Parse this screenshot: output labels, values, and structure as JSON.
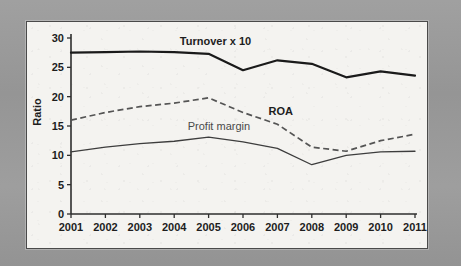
{
  "figure": {
    "panel_background": "#f4f3f0",
    "backdrop_color": "#9b9b9b",
    "border_color": "#4a4a4a"
  },
  "chart_data": {
    "type": "line",
    "title": "",
    "xlabel": "",
    "ylabel": "Ratio",
    "categories": [
      "2001",
      "2002",
      "2003",
      "2004",
      "2005",
      "2006",
      "2007",
      "2008",
      "2009",
      "2010",
      "2011"
    ],
    "x": [
      2001,
      2002,
      2003,
      2004,
      2005,
      2006,
      2007,
      2008,
      2009,
      2010,
      2011
    ],
    "ylim": [
      0,
      30
    ],
    "xlim": [
      2001,
      2011
    ],
    "yticks": [
      0,
      5,
      10,
      15,
      20,
      25,
      30
    ],
    "ytick_labels": [
      "0",
      "5",
      "10",
      "15",
      "20",
      "25",
      "30"
    ],
    "grid": false,
    "legend": "inline-labels",
    "series": [
      {
        "name": "Turnover x 10",
        "style": "solid-thick",
        "color": "#1a1a1a",
        "label_position": "above-line-near-2004",
        "values": [
          27.5,
          27.6,
          27.7,
          27.6,
          27.3,
          24.5,
          26.2,
          25.6,
          23.3,
          24.3,
          23.6
        ]
      },
      {
        "name": "ROA",
        "style": "dashed",
        "color": "#545454",
        "label_position": "above-line-near-2007",
        "values": [
          16.0,
          17.3,
          18.3,
          18.9,
          19.8,
          17.3,
          15.3,
          11.4,
          10.7,
          12.5,
          13.6
        ]
      },
      {
        "name": "Profit margin",
        "style": "solid-thin",
        "color": "#3d3d3d",
        "label_position": "above-line-near-2005",
        "values": [
          10.6,
          11.4,
          12.0,
          12.4,
          13.1,
          12.3,
          11.2,
          8.4,
          10.0,
          10.6,
          10.7
        ]
      }
    ],
    "annotations": [
      {
        "text": "Turnover x 10",
        "series": "Turnover x 10"
      },
      {
        "text": "ROA",
        "series": "ROA"
      },
      {
        "text": "Profit margin",
        "series": "Profit margin"
      }
    ]
  }
}
